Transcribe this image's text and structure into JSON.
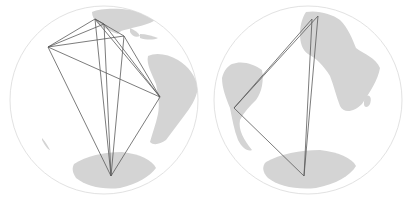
{
  "figure": {
    "width": 409,
    "height": 201,
    "colors": {
      "background": "#ffffff",
      "globe_outline": "#e2e2e2",
      "land": "#d4d4d4",
      "route": "#5a5a5a"
    }
  },
  "globes": [
    {
      "name": "globe-left",
      "center": [
        104,
        100
      ],
      "radius": 94,
      "points": [
        [
          48,
          47
        ],
        [
          95,
          19
        ],
        [
          104,
          24
        ],
        [
          124,
          36
        ],
        [
          160,
          97
        ],
        [
          111,
          176
        ]
      ],
      "routes": [
        [
          0,
          1
        ],
        [
          0,
          2
        ],
        [
          0,
          3
        ],
        [
          0,
          4
        ],
        [
          0,
          5
        ],
        [
          1,
          3
        ],
        [
          1,
          4
        ],
        [
          1,
          5
        ],
        [
          2,
          4
        ],
        [
          2,
          5
        ],
        [
          3,
          4
        ],
        [
          3,
          5
        ],
        [
          4,
          5
        ],
        [
          1,
          2
        ]
      ]
    },
    {
      "name": "globe-right",
      "center": [
        308,
        100
      ],
      "radius": 94,
      "points": [
        [
          234,
          108
        ],
        [
          312,
          19
        ],
        [
          318,
          16
        ],
        [
          304,
          176
        ]
      ],
      "routes": [
        [
          0,
          1
        ],
        [
          0,
          2
        ],
        [
          0,
          3
        ],
        [
          1,
          3
        ],
        [
          2,
          3
        ]
      ]
    }
  ]
}
